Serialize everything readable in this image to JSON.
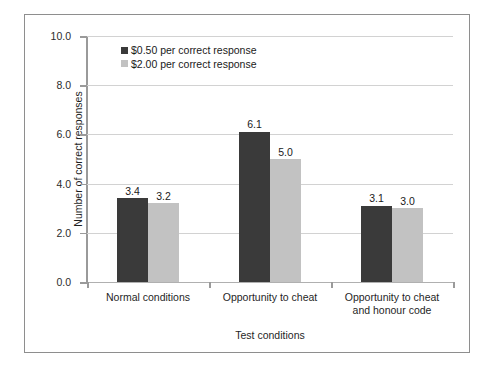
{
  "chart_data": {
    "type": "bar",
    "title": "",
    "xlabel": "Test conditions",
    "ylabel": "Number of correct responses",
    "ylim": [
      0,
      10
    ],
    "ytick_step": 2,
    "ytick_labels": [
      "0.0",
      "2.0",
      "4.0",
      "6.0",
      "8.0",
      "10.0"
    ],
    "ytick_values": [
      0,
      2,
      4,
      6,
      8,
      10
    ],
    "grid": "horizontal",
    "legend_position": "top-left-inside",
    "categories": [
      "Normal conditions",
      "Opportunity to cheat",
      "Opportunity to cheat and honour code"
    ],
    "category_label_lines": [
      [
        "Normal conditions"
      ],
      [
        "Opportunity to cheat"
      ],
      [
        "Opportunity to cheat",
        "and honour code"
      ]
    ],
    "series": [
      {
        "name": "$0.50 per correct response",
        "color": "#3a3a3a",
        "values": [
          3.4,
          6.1,
          3.1
        ],
        "labels": [
          "3.4",
          "6.1",
          "3.1"
        ]
      },
      {
        "name": "$2.00 per correct response",
        "color": "#c2c2c2",
        "values": [
          3.2,
          5.0,
          3.0
        ],
        "labels": [
          "3.2",
          "5.0",
          "3.0"
        ]
      }
    ]
  },
  "legend": {
    "items": [
      {
        "label": "$0.50 per correct response",
        "color": "#3a3a3a"
      },
      {
        "label": "$2.00 per correct response",
        "color": "#c2c2c2"
      }
    ]
  },
  "axes": {
    "y_title": "Number of correct responses",
    "x_title": "Test conditions"
  },
  "colors": {
    "series_a": "#3a3a3a",
    "series_b": "#c2c2c2",
    "frame_border": "#8e8e8e",
    "gridline": "#d2d2d2",
    "axis_line": "#9a9a9a",
    "background": "#ffffff"
  }
}
